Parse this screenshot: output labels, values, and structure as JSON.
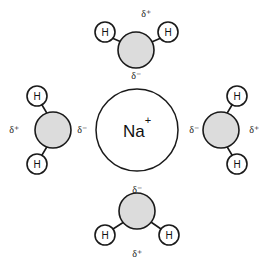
{
  "diagram": {
    "background_color": "#ffffff",
    "ion": {
      "label": "Na",
      "charge": "+",
      "full_label": "Na+",
      "cx": 137,
      "cy": 130,
      "r": 41,
      "fill": "#ffffff",
      "stroke": "#1a1a1a"
    },
    "colors": {
      "oxygen_fill": "#dcdcdc",
      "hydrogen_fill": "#ffffff",
      "outline": "#1a1a1a",
      "text": "#111111"
    },
    "atom_labels": {
      "hydrogen": "H"
    },
    "charge_symbols": {
      "partial_positive": "δ⁺",
      "partial_negative": "δ⁻"
    },
    "molecules": [
      {
        "name": "water-molecule-top",
        "position": "top",
        "oxygen": {
          "cx": 136,
          "cy": 50,
          "r": 18
        },
        "hydrogens": [
          {
            "name": "hydrogen-top-left",
            "cx": 105,
            "cy": 32,
            "r": 10,
            "label": "H"
          },
          {
            "name": "hydrogen-top-right",
            "cx": 168,
            "cy": 32,
            "r": 10,
            "label": "H"
          }
        ],
        "charges": [
          {
            "name": "charge-top-positive",
            "text": "δ⁺",
            "x": 146,
            "y": 13
          },
          {
            "name": "charge-top-negative",
            "text": "δ⁻",
            "x": 136,
            "y": 75
          }
        ]
      },
      {
        "name": "water-molecule-left",
        "position": "left",
        "oxygen": {
          "cx": 53,
          "cy": 130,
          "r": 18
        },
        "hydrogens": [
          {
            "name": "hydrogen-left-top",
            "cx": 37,
            "cy": 96,
            "r": 10,
            "label": "H"
          },
          {
            "name": "hydrogen-left-bottom",
            "cx": 37,
            "cy": 164,
            "r": 10,
            "label": "H"
          }
        ],
        "charges": [
          {
            "name": "charge-left-positive",
            "text": "δ⁺",
            "x": 14,
            "y": 129
          },
          {
            "name": "charge-left-negative",
            "text": "δ⁻",
            "x": 82,
            "y": 129
          }
        ]
      },
      {
        "name": "water-molecule-right",
        "position": "right",
        "oxygen": {
          "cx": 221,
          "cy": 130,
          "r": 18
        },
        "hydrogens": [
          {
            "name": "hydrogen-right-top",
            "cx": 237,
            "cy": 96,
            "r": 10,
            "label": "H"
          },
          {
            "name": "hydrogen-right-bottom",
            "cx": 237,
            "cy": 164,
            "r": 10,
            "label": "H"
          }
        ],
        "charges": [
          {
            "name": "charge-right-negative",
            "text": "δ⁻",
            "x": 194,
            "y": 129
          },
          {
            "name": "charge-right-positive",
            "text": "δ⁺",
            "x": 254,
            "y": 129
          }
        ]
      },
      {
        "name": "water-molecule-bottom",
        "position": "bottom",
        "oxygen": {
          "cx": 137,
          "cy": 211,
          "r": 18
        },
        "hydrogens": [
          {
            "name": "hydrogen-bottom-left",
            "cx": 105,
            "cy": 235,
            "r": 10,
            "label": "H"
          },
          {
            "name": "hydrogen-bottom-right",
            "cx": 169,
            "cy": 235,
            "r": 10,
            "label": "H"
          }
        ],
        "charges": [
          {
            "name": "charge-bottom-negative",
            "text": "δ⁻",
            "x": 137,
            "y": 189
          },
          {
            "name": "charge-bottom-positive",
            "text": "δ⁺",
            "x": 137,
            "y": 253
          }
        ]
      }
    ]
  }
}
